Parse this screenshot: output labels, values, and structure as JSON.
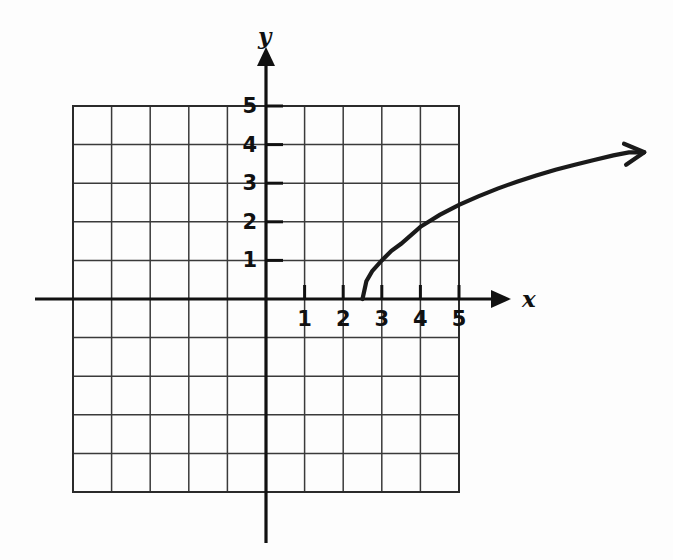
{
  "figure": {
    "kind": "coordinate-grid-graph",
    "background_color": "#fdfdfd",
    "ink_color": "#111111",
    "grid_color": "#3a3a3a"
  },
  "axes": {
    "x_axis_label": "x",
    "y_axis_label": "y",
    "x_tick_labels": [
      "1",
      "2",
      "3",
      "4",
      "5"
    ],
    "y_tick_labels": [
      "1",
      "2",
      "3",
      "4",
      "5"
    ],
    "x_tick_values": [
      1,
      2,
      3,
      4,
      5
    ],
    "y_tick_values": [
      1,
      2,
      3,
      4,
      5
    ],
    "origin_px": [
      266,
      299
    ],
    "unit_px": 38.6,
    "x_axis_arrow": "arrow-right",
    "y_axis_arrow": "arrow-up",
    "grid_x_range": [
      -5,
      5
    ],
    "grid_y_range": [
      -5,
      5
    ],
    "grid_visible": true
  },
  "chart_data": {
    "type": "line",
    "title": "",
    "xlabel": "x",
    "ylabel": "y",
    "xlim": [
      -5,
      5
    ],
    "ylim": [
      -5,
      5
    ],
    "grid": true,
    "legend": "none",
    "series": [
      {
        "name": "square-root-curve",
        "description": "Increasing concave-down square root curve starting on the x-axis at x = 2.5 and rising to the right with an arrowhead.",
        "start_point": [
          2.5,
          0
        ],
        "end_point": [
          9.8,
          3.8
        ],
        "arrowhead": "end",
        "x": [
          2.5,
          2.6,
          2.75,
          3.0,
          3.25,
          3.5,
          4.0,
          4.5,
          5.0,
          5.5,
          6.0,
          6.5,
          7.0,
          7.5,
          8.0,
          8.5,
          9.0,
          9.4
        ],
        "y": [
          0,
          0.46,
          0.72,
          1.0,
          1.25,
          1.43,
          1.87,
          2.18,
          2.44,
          2.66,
          2.86,
          3.04,
          3.2,
          3.35,
          3.48,
          3.6,
          3.72,
          3.8
        ]
      }
    ]
  }
}
